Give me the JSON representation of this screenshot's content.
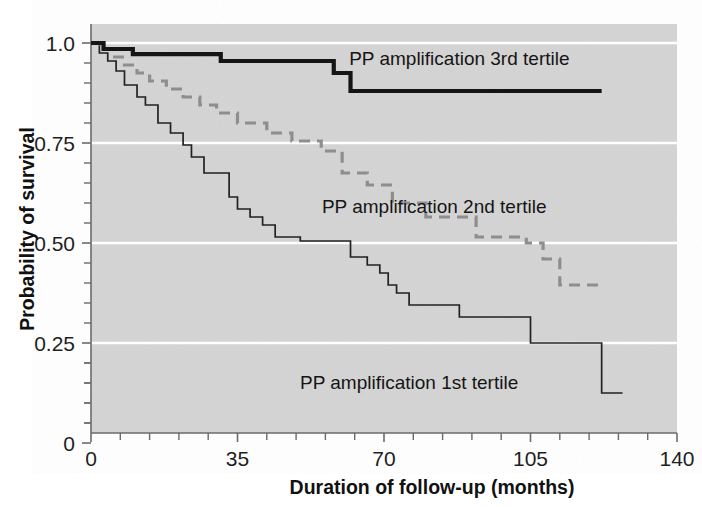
{
  "figure": {
    "kind": "kaplan-meier-survival-plot",
    "background_color": "#ffffff",
    "plot_background_color": "#d4d4d4",
    "gridline_color": "#ffffff"
  },
  "axes": {
    "y": {
      "label": "Probability of survival",
      "ticks": [
        "1.0",
        "0.75",
        "0.50",
        "0.25",
        "0"
      ],
      "tick_values": [
        1.0,
        0.75,
        0.5,
        0.25,
        0.0
      ],
      "range": [
        0.0,
        1.04
      ],
      "minor_ticks_per_interval": 4
    },
    "x": {
      "label": "Duration of follow-up (months)",
      "ticks": [
        "0",
        "35",
        "70",
        "105",
        "140"
      ],
      "tick_values": [
        0,
        35,
        70,
        105,
        140
      ],
      "range": [
        0,
        140
      ],
      "minor_ticks_per_interval": 4
    }
  },
  "series_labels": {
    "tertile3": "PP amplification 3rd tertile",
    "tertile2": "PP amplification 2nd tertile",
    "tertile1": "PP amplification 1st tertile"
  },
  "chart_data": {
    "type": "line",
    "title": "",
    "xlabel": "Duration of follow-up (months)",
    "ylabel": "Probability of survival",
    "xlim": [
      0,
      140
    ],
    "ylim": [
      0,
      1.04
    ],
    "grid": true,
    "legend_position": "inline-annotations",
    "step_style": "post",
    "series": [
      {
        "name": "PP amplification 3rd tertile",
        "style": "solid-thick",
        "color": "#151515",
        "label_x": 88,
        "label_y": 0.945,
        "x": [
          0,
          3,
          6,
          22,
          31,
          35,
          58,
          62,
          122
        ],
        "y": [
          1.0,
          1.0,
          0.985,
          0.972,
          0.972,
          0.955,
          0.955,
          0.925,
          0.88
        ],
        "points": [
          [
            0,
            1.0
          ],
          [
            3,
            1.0
          ],
          [
            3,
            0.985
          ],
          [
            10,
            0.985
          ],
          [
            10,
            0.972
          ],
          [
            31,
            0.972
          ],
          [
            31,
            0.955
          ],
          [
            58,
            0.955
          ],
          [
            58,
            0.925
          ],
          [
            62,
            0.925
          ],
          [
            62,
            0.88
          ],
          [
            122,
            0.88
          ]
        ]
      },
      {
        "name": "PP amplification 2nd tertile",
        "style": "dashed",
        "color": "#8e8e8e",
        "label_x": 82,
        "label_y": 0.575,
        "points": [
          [
            0,
            1.0
          ],
          [
            2,
            1.0
          ],
          [
            2,
            0.985
          ],
          [
            5,
            0.985
          ],
          [
            5,
            0.965
          ],
          [
            8,
            0.965
          ],
          [
            8,
            0.945
          ],
          [
            11,
            0.945
          ],
          [
            11,
            0.925
          ],
          [
            14,
            0.925
          ],
          [
            14,
            0.905
          ],
          [
            18,
            0.905
          ],
          [
            18,
            0.885
          ],
          [
            22,
            0.885
          ],
          [
            22,
            0.865
          ],
          [
            26,
            0.865
          ],
          [
            26,
            0.845
          ],
          [
            30,
            0.845
          ],
          [
            30,
            0.825
          ],
          [
            35,
            0.825
          ],
          [
            35,
            0.8
          ],
          [
            42,
            0.8
          ],
          [
            42,
            0.775
          ],
          [
            48,
            0.775
          ],
          [
            48,
            0.755
          ],
          [
            55,
            0.755
          ],
          [
            55,
            0.73
          ],
          [
            60,
            0.73
          ],
          [
            60,
            0.675
          ],
          [
            66,
            0.675
          ],
          [
            66,
            0.645
          ],
          [
            72,
            0.645
          ],
          [
            72,
            0.6
          ],
          [
            80,
            0.6
          ],
          [
            80,
            0.565
          ],
          [
            92,
            0.565
          ],
          [
            92,
            0.515
          ],
          [
            104,
            0.515
          ],
          [
            104,
            0.5
          ],
          [
            108,
            0.5
          ],
          [
            108,
            0.46
          ],
          [
            112,
            0.46
          ],
          [
            112,
            0.395
          ],
          [
            122,
            0.395
          ]
        ]
      },
      {
        "name": "PP amplification 1st tertile",
        "style": "solid-thin",
        "color": "#222222",
        "label_x": 76,
        "label_y": 0.135,
        "points": [
          [
            0,
            1.0
          ],
          [
            2,
            1.0
          ],
          [
            2,
            0.975
          ],
          [
            4,
            0.975
          ],
          [
            4,
            0.955
          ],
          [
            6,
            0.955
          ],
          [
            6,
            0.93
          ],
          [
            8,
            0.93
          ],
          [
            8,
            0.895
          ],
          [
            11,
            0.895
          ],
          [
            11,
            0.865
          ],
          [
            13,
            0.865
          ],
          [
            13,
            0.845
          ],
          [
            16,
            0.845
          ],
          [
            16,
            0.8
          ],
          [
            19,
            0.8
          ],
          [
            19,
            0.775
          ],
          [
            22,
            0.775
          ],
          [
            22,
            0.745
          ],
          [
            24,
            0.745
          ],
          [
            24,
            0.715
          ],
          [
            27,
            0.715
          ],
          [
            27,
            0.675
          ],
          [
            33,
            0.675
          ],
          [
            33,
            0.615
          ],
          [
            35,
            0.615
          ],
          [
            35,
            0.585
          ],
          [
            38,
            0.585
          ],
          [
            38,
            0.565
          ],
          [
            41,
            0.565
          ],
          [
            41,
            0.545
          ],
          [
            44,
            0.545
          ],
          [
            44,
            0.515
          ],
          [
            50,
            0.515
          ],
          [
            50,
            0.505
          ],
          [
            62,
            0.505
          ],
          [
            62,
            0.465
          ],
          [
            66,
            0.465
          ],
          [
            66,
            0.445
          ],
          [
            69,
            0.445
          ],
          [
            69,
            0.425
          ],
          [
            71,
            0.425
          ],
          [
            71,
            0.395
          ],
          [
            73,
            0.395
          ],
          [
            73,
            0.375
          ],
          [
            76,
            0.375
          ],
          [
            76,
            0.345
          ],
          [
            88,
            0.345
          ],
          [
            88,
            0.315
          ],
          [
            105,
            0.315
          ],
          [
            105,
            0.25
          ],
          [
            122,
            0.25
          ],
          [
            122,
            0.125
          ],
          [
            127,
            0.125
          ]
        ]
      }
    ]
  }
}
